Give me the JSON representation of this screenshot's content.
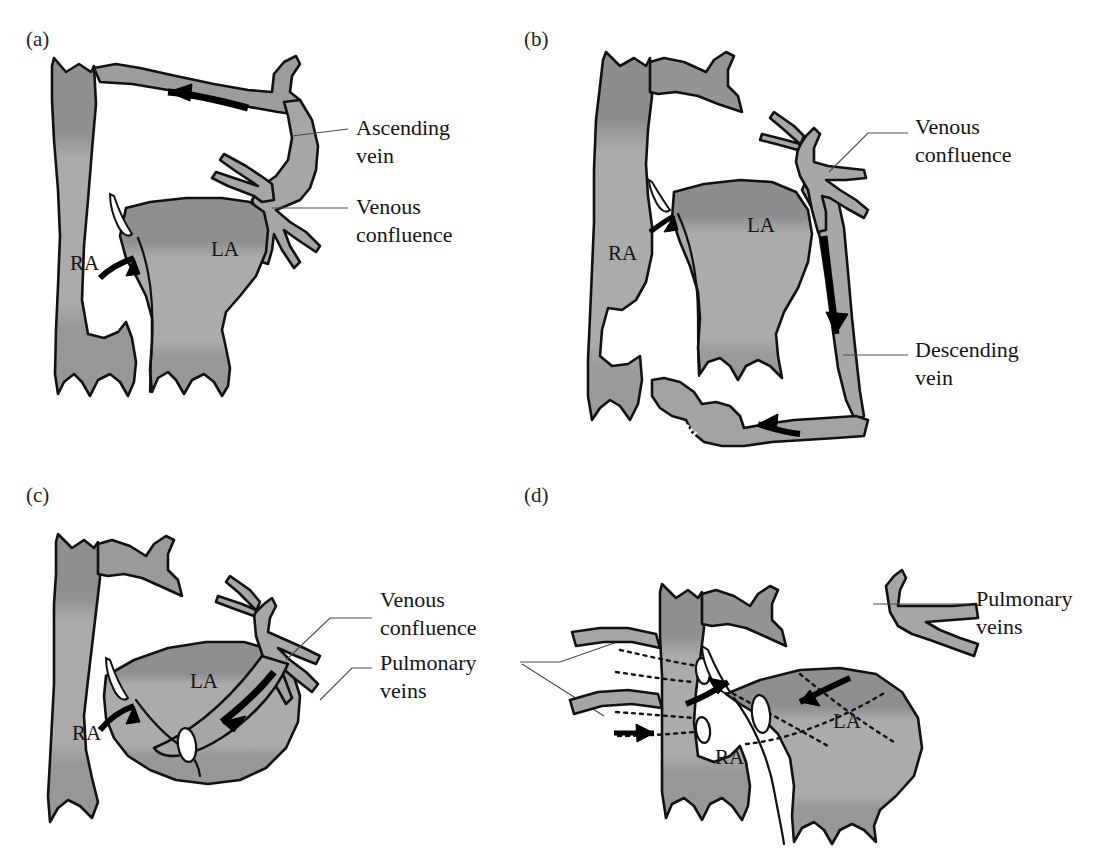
{
  "figure": {
    "background_color": "#ffffff",
    "line_color": "#111111",
    "fill_mid_gray": "#a9a9a9",
    "fill_dark_gray": "#8e8e8e",
    "fill_light_gray": "#b4b4b4",
    "arrow_color": "#000000",
    "leader_color": "#4a4a4a"
  },
  "panels": [
    {
      "id": "a",
      "label": "(a)",
      "chambers": [
        {
          "name": "RA",
          "label": "RA"
        },
        {
          "name": "LA",
          "label": "LA"
        }
      ],
      "annotations": [
        {
          "name": "ascending-vein",
          "lines": [
            "Ascending",
            "vein"
          ]
        },
        {
          "name": "venous-confluence",
          "lines": [
            "Venous",
            "confluence"
          ]
        }
      ],
      "flow_arrows": [
        {
          "name": "ascending-vein-flow",
          "direction": "leftward-along-arch"
        },
        {
          "name": "atrial-septal-shunt-flow",
          "direction": "rightward-into-la"
        }
      ]
    },
    {
      "id": "b",
      "label": "(b)",
      "chambers": [
        {
          "name": "RA",
          "label": "RA"
        },
        {
          "name": "LA",
          "label": "LA"
        }
      ],
      "annotations": [
        {
          "name": "venous-confluence",
          "lines": [
            "Venous",
            "confluence"
          ]
        },
        {
          "name": "descending-vein",
          "lines": [
            "Descending",
            "vein"
          ]
        }
      ],
      "flow_arrows": [
        {
          "name": "atrial-septal-shunt-flow",
          "direction": "rightward-into-la"
        },
        {
          "name": "descending-vein-flow",
          "direction": "downward"
        },
        {
          "name": "portal-inflow-flow",
          "direction": "leftward"
        }
      ]
    },
    {
      "id": "c",
      "label": "(c)",
      "chambers": [
        {
          "name": "RA",
          "label": "RA"
        },
        {
          "name": "LA",
          "label": "LA"
        }
      ],
      "annotations": [
        {
          "name": "venous-confluence",
          "lines": [
            "Venous",
            "confluence"
          ]
        },
        {
          "name": "pulmonary-veins",
          "lines": [
            "Pulmonary",
            "veins"
          ]
        }
      ],
      "flow_arrows": [
        {
          "name": "atrial-septal-shunt-flow",
          "direction": "rightward-into-la"
        },
        {
          "name": "confluence-to-coronary-sinus-flow",
          "direction": "leftward-downward"
        }
      ]
    },
    {
      "id": "d",
      "label": "(d)",
      "chambers": [
        {
          "name": "RA",
          "label": "RA"
        },
        {
          "name": "LA",
          "label": "LA"
        }
      ],
      "annotations": [
        {
          "name": "pulmonary-veins",
          "lines": [
            "Pulmonary",
            "veins"
          ]
        }
      ],
      "flow_arrows": [
        {
          "name": "right-pulmonary-vein-inflow",
          "direction": "rightward"
        },
        {
          "name": "atrial-septal-shunt-flow",
          "direction": "rightward-into-ra"
        },
        {
          "name": "left-pulmonary-vein-inflow",
          "direction": "leftward"
        }
      ]
    }
  ]
}
